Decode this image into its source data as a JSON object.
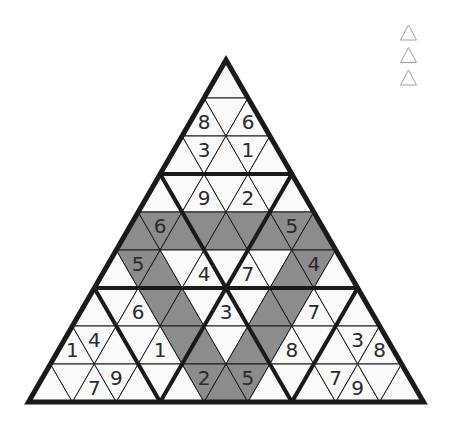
{
  "puzzle": {
    "type": "triangular-sudoku",
    "rows_count": 9,
    "colors": {
      "background": "#ffffff",
      "cell_white": "#fafafa",
      "cell_shaded": "#8c8c8c",
      "line": "#1a1a1a",
      "digit": "#2a2a2a"
    },
    "rows": [
      {
        "cells": [
          {
            "v": "",
            "s": 0
          }
        ]
      },
      {
        "cells": [
          {
            "v": "8",
            "s": 0
          },
          {
            "v": "",
            "s": 0
          },
          {
            "v": "6",
            "s": 0
          }
        ]
      },
      {
        "cells": [
          {
            "v": "",
            "s": 0
          },
          {
            "v": "3",
            "s": 0
          },
          {
            "v": "",
            "s": 0
          },
          {
            "v": "1",
            "s": 0
          },
          {
            "v": "",
            "s": 0
          }
        ]
      },
      {
        "cells": [
          {
            "v": "",
            "s": 0
          },
          {
            "v": "",
            "s": 0
          },
          {
            "v": "9",
            "s": 0
          },
          {
            "v": "",
            "s": 0
          },
          {
            "v": "2",
            "s": 0
          },
          {
            "v": "",
            "s": 0
          },
          {
            "v": "",
            "s": 0
          }
        ]
      },
      {
        "cells": [
          {
            "v": "",
            "s": 1
          },
          {
            "v": "6",
            "s": 1
          },
          {
            "v": "",
            "s": 1
          },
          {
            "v": "",
            "s": 1
          },
          {
            "v": "",
            "s": 1
          },
          {
            "v": "",
            "s": 1
          },
          {
            "v": "",
            "s": 1
          },
          {
            "v": "5",
            "s": 1
          },
          {
            "v": "",
            "s": 1
          }
        ]
      },
      {
        "cells": [
          {
            "v": "",
            "s": 0
          },
          {
            "v": "5",
            "s": 1
          },
          {
            "v": "",
            "s": 1
          },
          {
            "v": "",
            "s": 0
          },
          {
            "v": "4",
            "s": 0
          },
          {
            "v": "",
            "s": 0
          },
          {
            "v": "7",
            "s": 0
          },
          {
            "v": "",
            "s": 0
          },
          {
            "v": "",
            "s": 1
          },
          {
            "v": "4",
            "s": 1
          },
          {
            "v": "",
            "s": 0
          }
        ]
      },
      {
        "cells": [
          {
            "v": "",
            "s": 0
          },
          {
            "v": "",
            "s": 0
          },
          {
            "v": "6",
            "s": 0
          },
          {
            "v": "",
            "s": 1
          },
          {
            "v": "",
            "s": 1
          },
          {
            "v": "",
            "s": 0
          },
          {
            "v": "3",
            "s": 0
          },
          {
            "v": "",
            "s": 0
          },
          {
            "v": "",
            "s": 1
          },
          {
            "v": "",
            "s": 1
          },
          {
            "v": "7",
            "s": 0
          },
          {
            "v": "",
            "s": 0
          },
          {
            "v": "",
            "s": 0
          }
        ]
      },
      {
        "cells": [
          {
            "v": "1",
            "s": 0
          },
          {
            "v": "4",
            "s": 0
          },
          {
            "v": "",
            "s": 0
          },
          {
            "v": "",
            "s": 0
          },
          {
            "v": "1",
            "s": 0
          },
          {
            "v": "",
            "s": 1
          },
          {
            "v": "",
            "s": 1
          },
          {
            "v": "",
            "s": 0
          },
          {
            "v": "",
            "s": 1
          },
          {
            "v": "",
            "s": 1
          },
          {
            "v": "8",
            "s": 0
          },
          {
            "v": "",
            "s": 0
          },
          {
            "v": "",
            "s": 0
          },
          {
            "v": "3",
            "s": 0
          },
          {
            "v": "8",
            "s": 0
          }
        ]
      },
      {
        "cells": [
          {
            "v": "",
            "s": 0
          },
          {
            "v": "",
            "s": 0
          },
          {
            "v": "7",
            "s": 0
          },
          {
            "v": "9",
            "s": 0
          },
          {
            "v": "",
            "s": 0
          },
          {
            "v": "",
            "s": 0
          },
          {
            "v": "",
            "s": 0
          },
          {
            "v": "2",
            "s": 1
          },
          {
            "v": "",
            "s": 1
          },
          {
            "v": "5",
            "s": 1
          },
          {
            "v": "",
            "s": 0
          },
          {
            "v": "",
            "s": 0
          },
          {
            "v": "",
            "s": 0
          },
          {
            "v": "7",
            "s": 0
          },
          {
            "v": "9",
            "s": 0
          },
          {
            "v": "",
            "s": 0
          },
          {
            "v": "",
            "s": 0
          }
        ]
      }
    ]
  },
  "side_icons": [
    {
      "name": "triangle-outline-icon-1"
    },
    {
      "name": "triangle-outline-icon-2"
    },
    {
      "name": "triangle-outline-icon-3"
    }
  ]
}
